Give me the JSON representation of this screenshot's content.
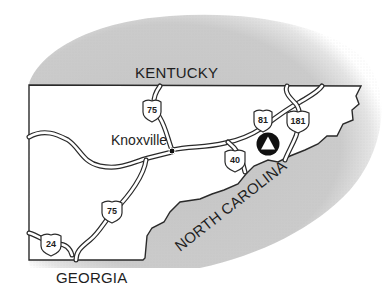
{
  "map": {
    "title": "East Tennessee location map",
    "colors": {
      "background": "#ffffff",
      "neighbor_states": "#c8c8c8",
      "tennessee": "#ffffff",
      "outline": "#2a2a2a",
      "text": "#1e1e1e",
      "marker": "#111111"
    },
    "states": [
      {
        "id": "kentucky",
        "label": "KENTUCKY"
      },
      {
        "id": "north-carolina",
        "label": "NORTH CAROLINA"
      },
      {
        "id": "georgia",
        "label": "GEORGIA"
      }
    ],
    "cities": [
      {
        "id": "knoxville",
        "label": "Knoxville"
      }
    ],
    "highways": [
      {
        "id": "i75-north",
        "number": "75",
        "type": "interstate"
      },
      {
        "id": "i81",
        "number": "81",
        "type": "interstate"
      },
      {
        "id": "i181",
        "number": "181",
        "type": "interstate"
      },
      {
        "id": "i40",
        "number": "40",
        "type": "interstate"
      },
      {
        "id": "i75-south",
        "number": "75",
        "type": "interstate"
      },
      {
        "id": "i24",
        "number": "24",
        "type": "interstate"
      }
    ],
    "marker": {
      "id": "location-marker",
      "shape": "triangle-in-circle"
    }
  }
}
